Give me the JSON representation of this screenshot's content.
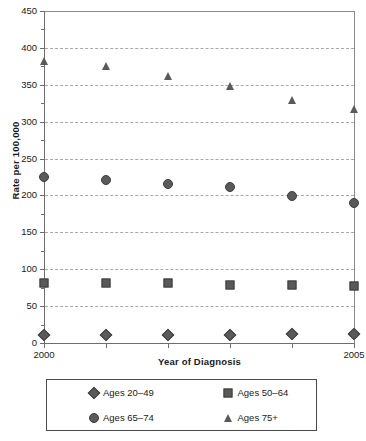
{
  "chart_data": {
    "type": "scatter",
    "title": "",
    "xlabel": "Year of Diagnosis",
    "ylabel": "Rate per 100,000",
    "x": [
      2000,
      2001,
      2002,
      2003,
      2004,
      2005
    ],
    "xlim": [
      2000,
      2005
    ],
    "ylim": [
      0,
      450
    ],
    "ytick_labels": [
      "0",
      "50",
      "100",
      "150",
      "200",
      "250",
      "300",
      "350",
      "400",
      "450"
    ],
    "ytick_values": [
      0,
      50,
      100,
      150,
      200,
      250,
      300,
      350,
      400,
      450
    ],
    "xtick_labels": [
      "2000",
      "",
      "",
      "",
      "",
      "2005"
    ],
    "grid": "horizontal-dashed",
    "legend_position": "below-plot",
    "marker_color": "#5a5a5a",
    "series": [
      {
        "name": "Ages 20–49",
        "marker": "diamond",
        "values": [
          11,
          11,
          11,
          11,
          12,
          12
        ]
      },
      {
        "name": "Ages 50–64",
        "marker": "square",
        "values": [
          81,
          81,
          81,
          78,
          78,
          77
        ]
      },
      {
        "name": "Ages 65–74",
        "marker": "circle",
        "values": [
          225,
          221,
          216,
          211,
          199,
          190
        ]
      },
      {
        "name": "Ages 75+",
        "marker": "triangle",
        "values": [
          382,
          375,
          362,
          349,
          329,
          317
        ]
      }
    ]
  },
  "legend": {
    "items": [
      {
        "label": "Ages 20–49",
        "marker": "diamond"
      },
      {
        "label": "Ages 50–64",
        "marker": "square"
      },
      {
        "label": "Ages 65–74",
        "marker": "circle"
      },
      {
        "label": "Ages 75+",
        "marker": "triangle"
      }
    ]
  }
}
